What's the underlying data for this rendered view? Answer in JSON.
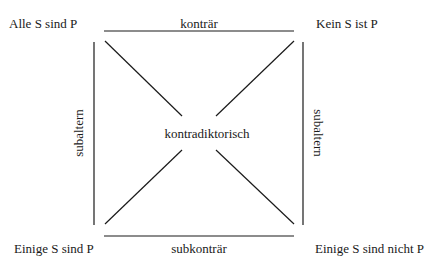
{
  "diagram": {
    "corners": {
      "top_left": "Alle S sind P",
      "top_right": "Kein S ist P",
      "bottom_left": "Einige S sind P",
      "bottom_right": "Einige S sind nicht P"
    },
    "relations": {
      "top": "konträr",
      "bottom": "subkonträr",
      "left": "subaltern",
      "right": "subaltern",
      "diagonal": "kontradiktorisch"
    },
    "colors": {
      "line": "#1a1a1a",
      "text": "#1a1a1a",
      "background": "#ffffff"
    }
  }
}
